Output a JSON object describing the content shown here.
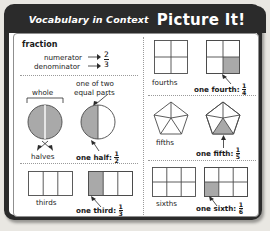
{
  "header": {
    "kicker": "Vocabulary in Context",
    "title": "Picture It!"
  },
  "left_column": {
    "section_title": "fraction",
    "fraction_example": {
      "numerator_label": "numerator",
      "denominator_label": "denominator",
      "numerator_value": "2",
      "denominator_value": "3",
      "arrow": "→"
    },
    "halves": {
      "callout": "one of two\nequal parts",
      "callout_line1": "one of two",
      "callout_line2": "equal parts",
      "whole_label": "whole",
      "parts_label": "halves",
      "answer_text": "one half:",
      "answer_numerator": "1",
      "answer_denominator": "2"
    },
    "thirds": {
      "parts_label": "thirds",
      "answer_text": "one third:",
      "answer_numerator": "1",
      "answer_denominator": "3"
    }
  },
  "right_column": {
    "fourths": {
      "parts_label": "fourths",
      "answer_text": "one fourth:",
      "answer_numerator": "1",
      "answer_denominator": "4"
    },
    "fifths": {
      "parts_label": "fifths",
      "answer_text": "one fifth:",
      "answer_numerator": "1",
      "answer_denominator": "5"
    },
    "sixths": {
      "parts_label": "sixths",
      "answer_text": "one sixth:",
      "answer_numerator": "1",
      "answer_denominator": "6"
    }
  },
  "colors": {
    "frame": "#2b2b2b",
    "shaded": "#a9a9a9",
    "outline": "#4a4a4a",
    "page_background": "#e9e7e2"
  },
  "diagram_data": {
    "type": "diagram",
    "shapes": [
      {
        "name": "whole-circle",
        "total_parts": 2,
        "shaded_parts": 2,
        "shape": "circle"
      },
      {
        "name": "one-half-circle",
        "total_parts": 2,
        "shaded_parts": 1,
        "shape": "circle"
      },
      {
        "name": "thirds-bar",
        "total_parts": 3,
        "shaded_parts": 0,
        "shape": "rectangle"
      },
      {
        "name": "one-third-bar",
        "total_parts": 3,
        "shaded_parts": 1,
        "shape": "rectangle"
      },
      {
        "name": "fourths-grid",
        "total_parts": 4,
        "shaded_parts": 0,
        "shape": "square-grid"
      },
      {
        "name": "one-fourth-grid",
        "total_parts": 4,
        "shaded_parts": 1,
        "shape": "square-grid"
      },
      {
        "name": "fifths-pentagon",
        "total_parts": 5,
        "shaded_parts": 0,
        "shape": "pentagon"
      },
      {
        "name": "one-fifth-pentagon",
        "total_parts": 5,
        "shaded_parts": 1,
        "shape": "pentagon"
      },
      {
        "name": "sixths-grid",
        "total_parts": 6,
        "shaded_parts": 0,
        "shape": "rect-grid"
      },
      {
        "name": "one-sixth-grid",
        "total_parts": 6,
        "shaded_parts": 1,
        "shape": "rect-grid"
      }
    ]
  }
}
